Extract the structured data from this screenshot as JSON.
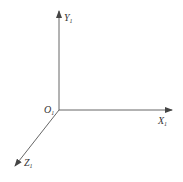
{
  "diagram": {
    "type": "3d-coordinate-axes",
    "stroke_color": "#555555",
    "origin": {
      "label": "O",
      "subscript": "1"
    },
    "axes": [
      {
        "name": "y-axis",
        "label": "Y",
        "subscript": "1"
      },
      {
        "name": "x-axis",
        "label": "X",
        "subscript": "1"
      },
      {
        "name": "z-axis",
        "label": "Z",
        "subscript": "1"
      }
    ]
  }
}
